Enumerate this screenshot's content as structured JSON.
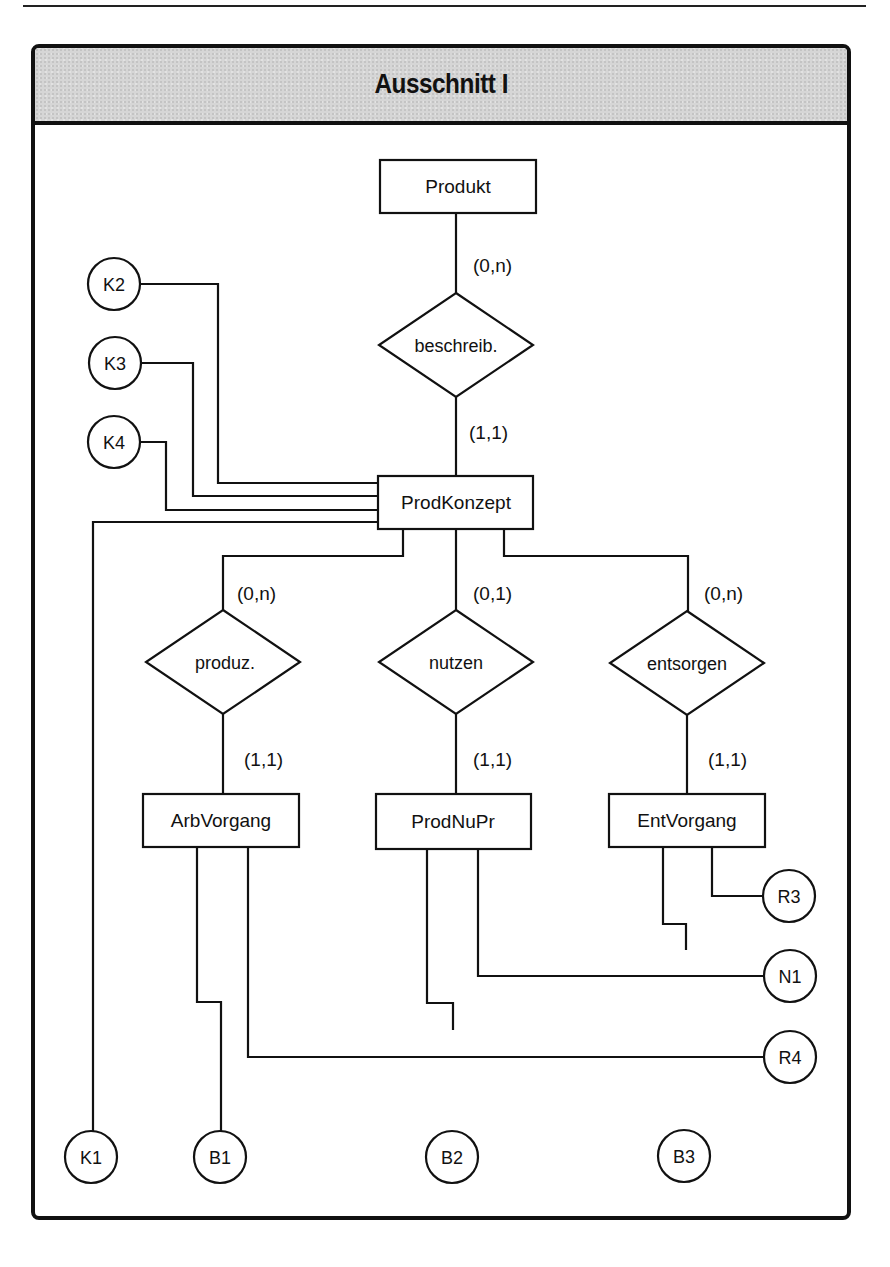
{
  "frame": {
    "title": "Ausschnitt I"
  },
  "entities": [
    {
      "id": "produkt",
      "label": "Produkt",
      "x": 380,
      "y": 160,
      "w": 156,
      "h": 53
    },
    {
      "id": "prodkonzept",
      "label": "ProdKonzept",
      "x": 378,
      "y": 476,
      "w": 155,
      "h": 53
    },
    {
      "id": "arbvorgang",
      "label": "ArbVorgang",
      "x": 143,
      "y": 794,
      "w": 156,
      "h": 53
    },
    {
      "id": "prodnupr",
      "label": "ProdNuPr",
      "x": 376,
      "y": 794,
      "w": 155,
      "h": 55
    },
    {
      "id": "entvorgang",
      "label": "EntVorgang",
      "x": 609,
      "y": 794,
      "w": 156,
      "h": 53
    }
  ],
  "relationships": [
    {
      "id": "beschreib",
      "label": "beschreib.",
      "cx": 456,
      "cy": 345,
      "hw": 77,
      "hh": 52
    },
    {
      "id": "produz",
      "label": "produz.",
      "cx": 223,
      "cy": 662,
      "hw": 77,
      "hh": 52
    },
    {
      "id": "nutzen",
      "label": "nutzen",
      "cx": 456,
      "cy": 662,
      "hw": 77,
      "hh": 52
    },
    {
      "id": "entsorgen",
      "label": "entsorgen",
      "cx": 687,
      "cy": 663,
      "hw": 77,
      "hh": 52
    }
  ],
  "cardinalities": [
    {
      "id": "produkt-beschreib",
      "label": "(0,n)",
      "x": 473,
      "y": 265
    },
    {
      "id": "beschreib-prodkonzept",
      "label": "(1,1)",
      "x": 469,
      "y": 432
    },
    {
      "id": "prodkonzept-produz",
      "label": "(0,n)",
      "x": 237,
      "y": 600
    },
    {
      "id": "produz-arbvorgang",
      "label": "(1,1)",
      "x": 244,
      "y": 764
    },
    {
      "id": "prodkonzept-nutzen",
      "label": "(0,1)",
      "x": 473,
      "y": 600
    },
    {
      "id": "nutzen-prodnupr",
      "label": "(1,1)",
      "x": 473,
      "y": 764
    },
    {
      "id": "prodkonzept-entsorgen",
      "label": "(0,n)",
      "x": 704,
      "y": 600
    },
    {
      "id": "entsorgen-entvorgang",
      "label": "(1,1)",
      "x": 708,
      "y": 764
    }
  ],
  "attributes": [
    {
      "id": "k1",
      "label": "K1",
      "cx": 91,
      "cy": 1157
    },
    {
      "id": "k2",
      "label": "K2",
      "cx": 114,
      "cy": 284
    },
    {
      "id": "k3",
      "label": "K3",
      "cx": 115,
      "cy": 363
    },
    {
      "id": "k4",
      "label": "K4",
      "cx": 114,
      "cy": 442
    },
    {
      "id": "b1",
      "label": "B1",
      "cx": 220,
      "cy": 1157
    },
    {
      "id": "b2",
      "label": "B2",
      "cx": 452,
      "cy": 1157
    },
    {
      "id": "b3",
      "label": "B3",
      "cx": 684,
      "cy": 1156
    },
    {
      "id": "r3",
      "label": "R3",
      "cx": 789,
      "cy": 896
    },
    {
      "id": "n1",
      "label": "N1",
      "cx": 790,
      "cy": 976
    },
    {
      "id": "r4",
      "label": "R4",
      "cx": 790,
      "cy": 1057
    }
  ],
  "attribute_radius": 26
}
